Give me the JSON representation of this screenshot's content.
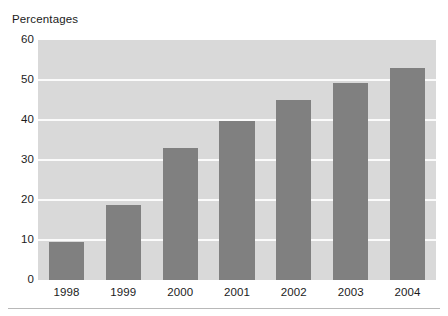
{
  "chart_data": {
    "type": "bar",
    "title": "Percentages",
    "xlabel": "",
    "ylabel": "",
    "categories": [
      "1998",
      "1999",
      "2000",
      "2001",
      "2002",
      "2003",
      "2004"
    ],
    "values": [
      9.5,
      18.8,
      33,
      39.7,
      45,
      49.2,
      53
    ],
    "series": [
      {
        "name": "Percentages",
        "values": [
          9.5,
          18.8,
          33,
          39.7,
          45,
          49.2,
          53
        ]
      }
    ],
    "ylim": [
      0,
      60
    ],
    "yticks": [
      0,
      10,
      20,
      30,
      40,
      50,
      60
    ],
    "ytick_labels": [
      "0",
      "10",
      "20",
      "30",
      "40",
      "50",
      "60"
    ],
    "grid": true,
    "grid_axis": "y",
    "grid_color": "#fbfbfb",
    "legend": false,
    "legend_position": "none",
    "bar_color": "#808080",
    "plot_background": "#d9d9d9",
    "figure_background": "#ffffff",
    "text_color": "#1b1b1b"
  }
}
